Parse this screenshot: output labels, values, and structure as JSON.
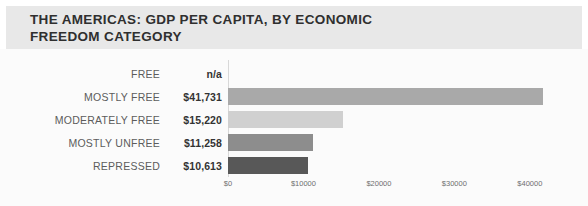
{
  "header": {
    "title": "THE AMERICAS: GDP PER CAPITA, BY ECONOMIC\nFREEDOM CATEGORY"
  },
  "chart_data": {
    "type": "bar",
    "orientation": "horizontal",
    "title": "THE AMERICAS: GDP PER CAPITA, BY ECONOMIC FREEDOM CATEGORY",
    "xlabel": "",
    "ylabel": "",
    "grid": false,
    "legend": null,
    "xlim": [
      0,
      44000
    ],
    "categories": [
      "FREE",
      "MOSTLY FREE",
      "MODERATELY FREE",
      "MOSTLY UNFREE",
      "REPRESSED"
    ],
    "values": [
      null,
      41731,
      15220,
      11258,
      10613
    ],
    "value_labels": [
      "n/a",
      "$41,731",
      "$15,220",
      "$11,258",
      "$10,613"
    ],
    "bar_colors": [
      "none",
      "#a9a9a9",
      "#d0d0d0",
      "#8d8d8d",
      "#585858"
    ],
    "xticks": [
      0,
      10000,
      20000,
      30000,
      40000
    ],
    "xtick_labels": [
      "$0",
      "$10000",
      "$20000",
      "$30000",
      "$40000"
    ]
  },
  "colors": {
    "header_band": "#e8e8e8",
    "title_text": "#2f2f2f",
    "label_text": "#5c5c5c",
    "value_text": "#333333",
    "axis_line": "#d8d8d8",
    "plot_background": "#fbfbfb"
  }
}
